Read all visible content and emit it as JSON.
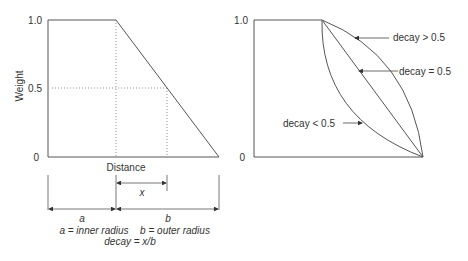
{
  "left_diagram": {
    "y_axis_label": "Weight",
    "y_ticks": [
      "1.0",
      "0.5",
      "0"
    ],
    "x_axis_label": "Distance",
    "dim_x": "x",
    "dim_a": "a",
    "dim_b": "b",
    "legend_a": "a = inner radius",
    "legend_b": "b = outer radius",
    "formula": "decay = x/b"
  },
  "right_diagram": {
    "y_ticks": [
      "1.0",
      "0"
    ],
    "annotations": {
      "gt": "decay > 0.5",
      "eq": "decay = 0.5",
      "lt": "decay < 0.5"
    }
  },
  "colors": {
    "line": "#555555",
    "text": "#333333",
    "background": "#ffffff"
  }
}
